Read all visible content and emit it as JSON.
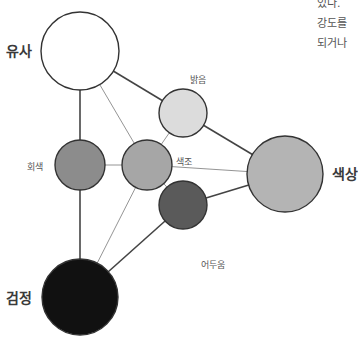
{
  "diagram": {
    "nodes": [
      {
        "id": "yusa",
        "label": "유사",
        "cx": 80,
        "cy": 51,
        "r": 39,
        "fill": "#ffffff"
      },
      {
        "id": "balgeum",
        "label": "밝음",
        "cx": 183,
        "cy": 113,
        "r": 24,
        "fill": "#dcdcdc"
      },
      {
        "id": "hoesaek",
        "label": "회색",
        "cx": 80,
        "cy": 165,
        "r": 25,
        "fill": "#8c8c8c"
      },
      {
        "id": "saekjo",
        "label": "색조",
        "cx": 147,
        "cy": 165,
        "r": 25,
        "fill": "#a6a6a6"
      },
      {
        "id": "saeksang",
        "label": "색상",
        "cx": 285,
        "cy": 174,
        "r": 38,
        "fill": "#b4b4b4"
      },
      {
        "id": "eoduum",
        "label": "어두움",
        "cx": 183,
        "cy": 205,
        "r": 24,
        "fill": "#5a5a5a"
      },
      {
        "id": "geomjeong",
        "label": "검정",
        "cx": 80,
        "cy": 297,
        "r": 38,
        "fill": "#111111"
      }
    ],
    "edges": [
      {
        "from": "yusa",
        "to": "hoesaek",
        "weight": "thick"
      },
      {
        "from": "yusa",
        "to": "balgeum",
        "weight": "thick"
      },
      {
        "from": "yusa",
        "to": "saekjo",
        "weight": "thin"
      },
      {
        "from": "hoesaek",
        "to": "geomjeong",
        "weight": "thick"
      },
      {
        "from": "hoesaek",
        "to": "saekjo",
        "weight": "thin"
      },
      {
        "from": "balgeum",
        "to": "saekjo",
        "weight": "thin"
      },
      {
        "from": "balgeum",
        "to": "saeksang",
        "weight": "thick"
      },
      {
        "from": "saekjo",
        "to": "saeksang",
        "weight": "thin"
      },
      {
        "from": "saekjo",
        "to": "eoduum",
        "weight": "thin"
      },
      {
        "from": "saekjo",
        "to": "geomjeong",
        "weight": "thin"
      },
      {
        "from": "eoduum",
        "to": "saeksang",
        "weight": "thick"
      },
      {
        "from": "eoduum",
        "to": "geomjeong",
        "weight": "thick"
      }
    ],
    "labels": {
      "yusa": "유사",
      "balgeum": "밝음",
      "hoesaek": "회색",
      "saekjo": "색조",
      "saeksang": "색상",
      "eoduum": "어두움",
      "geomjeong": "검정"
    }
  },
  "side_text": {
    "line1": "있다.",
    "line2": "강도를",
    "line3": "되거나"
  }
}
